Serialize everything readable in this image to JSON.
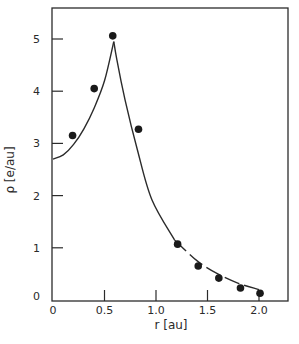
{
  "chart_data": {
    "type": "scatter",
    "title": "",
    "xlabel": "r [au]",
    "ylabel": "ρ [e/au]",
    "xlim": [
      0,
      2.3
    ],
    "ylim": [
      0,
      5.6
    ],
    "grid": false,
    "legend": null,
    "x_ticks": [
      {
        "value": 0,
        "label": "0"
      },
      {
        "value": 0.5,
        "label": "0.5"
      },
      {
        "value": 1.0,
        "label": "1.0"
      },
      {
        "value": 1.5,
        "label": "1.5"
      },
      {
        "value": 2.0,
        "label": "2.0"
      }
    ],
    "y_ticks": [
      {
        "value": 0,
        "label": "0"
      },
      {
        "value": 1,
        "label": "1"
      },
      {
        "value": 2,
        "label": "2"
      },
      {
        "value": 3,
        "label": "3"
      },
      {
        "value": 4,
        "label": "4"
      },
      {
        "value": 5,
        "label": "5"
      }
    ],
    "series": [
      {
        "name": "measured points",
        "style": "filled-circle markers",
        "x": [
          0.19,
          0.4,
          0.58,
          0.83,
          1.21,
          1.41,
          1.61,
          1.82,
          2.01
        ],
        "y": [
          3.15,
          4.05,
          5.06,
          3.27,
          1.07,
          0.65,
          0.42,
          0.23,
          0.13
        ]
      },
      {
        "name": "theory curve",
        "style": "solid line (dashed beyond r≈1.2)",
        "x": [
          0,
          0.1,
          0.2,
          0.3,
          0.4,
          0.5,
          0.59,
          0.62,
          0.7,
          0.82,
          0.96,
          1.18,
          1.4,
          1.6,
          1.8,
          2.0
        ],
        "y": [
          2.7,
          2.78,
          2.98,
          3.28,
          3.68,
          4.2,
          4.95,
          4.6,
          3.83,
          2.87,
          1.92,
          1.15,
          0.75,
          0.5,
          0.32,
          0.2
        ]
      }
    ]
  }
}
